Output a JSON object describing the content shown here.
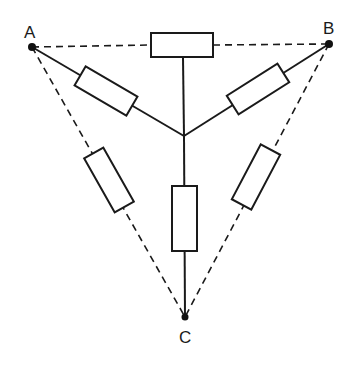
{
  "diagram": {
    "type": "resistor network (star and delta)",
    "nodes": [
      {
        "id": "A",
        "label": "A",
        "x": 32,
        "y": 47
      },
      {
        "id": "B",
        "label": "B",
        "x": 329,
        "y": 44
      },
      {
        "id": "C",
        "label": "C",
        "x": 185,
        "y": 317
      }
    ],
    "center": {
      "x": 184,
      "y": 136
    },
    "star_resistors": [
      "A-center",
      "B-center",
      "C-center",
      "top-center"
    ],
    "delta_resistors": [
      "A-B (dashed)",
      "A-C (dashed)",
      "B-C (dashed)"
    ],
    "colors": {
      "line": "#1a1a1a",
      "background": "#ffffff"
    }
  }
}
